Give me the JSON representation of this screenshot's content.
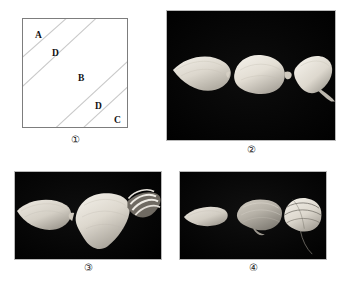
{
  "figure": {
    "background_color": "#ffffff",
    "panel_count": 4,
    "layout": "2x2 grid of panels, each with a circled numeral caption below"
  },
  "panels": [
    {
      "id": "panel-1",
      "caption": "①",
      "type": "schematic-diagram",
      "description": "Square outline divided by four parallel diagonal lines into five zones labelled A, D, B, D, C from upper-left to lower-right",
      "border_color": "#7d7d7d",
      "line_color": "#c9c9c9",
      "fill_color": "#ffffff",
      "zones": [
        {
          "label": "A",
          "position": "upper-left corner"
        },
        {
          "label": "D",
          "position": "upper band"
        },
        {
          "label": "B",
          "position": "central wide band"
        },
        {
          "label": "D",
          "position": "lower band"
        },
        {
          "label": "C",
          "position": "lower-right corner"
        }
      ]
    },
    {
      "id": "panel-2",
      "caption": "②",
      "type": "photograph",
      "background_color": "#000000",
      "description": "Three pale specimens on a black background: a pointed leaf-like blade at left, a rounded swollen body at centre, and a curved pointed blade at right",
      "specimen_color": "#e8e4dc",
      "specimen_count": 3
    },
    {
      "id": "panel-3",
      "caption": "③",
      "type": "photograph",
      "background_color": "#000000",
      "description": "A pale pointed leaf-like blade at left and a large broad specimen at right bearing a dark banded coiled appendage",
      "specimen_color": "#ddd8cf",
      "specimen_count": 2
    },
    {
      "id": "panel-4",
      "caption": "④",
      "type": "photograph",
      "background_color": "#000000",
      "description": "A narrow pale blade at left, a ribbed folded specimen at centre, and a rounded banded body with a fine trailing filament at right",
      "specimen_color": "#d9d4cb",
      "specimen_count": 3
    }
  ]
}
